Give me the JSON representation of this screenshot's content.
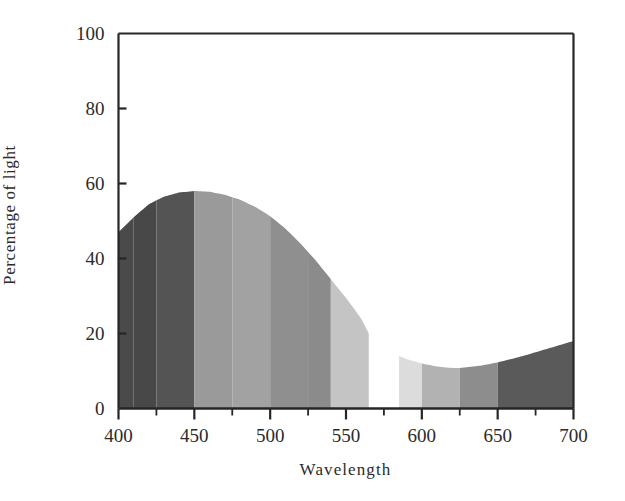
{
  "chart_data": {
    "type": "area",
    "title": "",
    "xlabel": "Wavelength",
    "ylabel": "Percentage of light",
    "xlim": [
      400,
      700
    ],
    "ylim": [
      0,
      100
    ],
    "xticks": [
      400,
      450,
      500,
      550,
      600,
      650,
      700
    ],
    "xtick_labels": [
      "400",
      "450",
      "500",
      "550",
      "600",
      "650",
      "700"
    ],
    "xminor_step": 25,
    "yticks": [
      0,
      20,
      40,
      60,
      80,
      100
    ],
    "ytick_labels": [
      "0",
      "20",
      "40",
      "60",
      "80",
      "100"
    ],
    "grid": false,
    "legend": null,
    "x": [
      400,
      410,
      420,
      430,
      440,
      450,
      460,
      470,
      480,
      490,
      500,
      510,
      520,
      530,
      540,
      550,
      560,
      565,
      585,
      590,
      600,
      610,
      620,
      625,
      630,
      640,
      650,
      660,
      670,
      680,
      690,
      700
    ],
    "values": [
      47,
      51,
      54.5,
      56.5,
      57.6,
      58,
      57.8,
      57,
      55.7,
      53.8,
      51.3,
      48,
      44,
      39.5,
      34.5,
      29.5,
      24,
      20,
      14,
      13.2,
      12,
      11.2,
      10.8,
      10.8,
      11,
      11.5,
      12.3,
      13.3,
      14.4,
      15.6,
      16.8,
      18
    ],
    "gap": {
      "start": 565,
      "end": 585,
      "note": "unfilled white region between 565 and 585 nm"
    },
    "bands": [
      {
        "start": 400,
        "end": 410,
        "color": "#4a4a4a"
      },
      {
        "start": 410,
        "end": 425,
        "color": "#484848"
      },
      {
        "start": 425,
        "end": 450,
        "color": "#545454"
      },
      {
        "start": 450,
        "end": 475,
        "color": "#9a9a9a"
      },
      {
        "start": 475,
        "end": 500,
        "color": "#a2a2a2"
      },
      {
        "start": 500,
        "end": 525,
        "color": "#8f8f8f"
      },
      {
        "start": 525,
        "end": 540,
        "color": "#8b8b8b"
      },
      {
        "start": 540,
        "end": 565,
        "color": "#c4c4c4"
      },
      {
        "start": 585,
        "end": 600,
        "color": "#dcdcdc"
      },
      {
        "start": 600,
        "end": 625,
        "color": "#b2b2b2"
      },
      {
        "start": 625,
        "end": 650,
        "color": "#8d8d8d"
      },
      {
        "start": 650,
        "end": 700,
        "color": "#5a5a5a"
      }
    ],
    "axis_color": "#262626",
    "background": "#ffffff"
  }
}
